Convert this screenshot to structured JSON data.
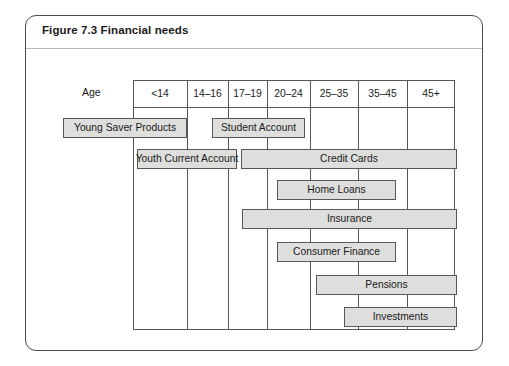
{
  "figure": {
    "title": "Figure 7.3 Financial needs",
    "axis_label": "Age"
  },
  "chart_data": {
    "type": "bar",
    "title": "Figure 7.3 Financial needs",
    "xlabel": "Age",
    "ylabel": "",
    "orientation": "horizontal",
    "grid": true,
    "legend": "none",
    "categories": [
      "<14",
      "14–16",
      "17–19",
      "20–24",
      "25–35",
      "35–45",
      "45+"
    ],
    "axis_ticks_px": [
      133,
      187,
      228,
      267,
      310,
      358,
      407,
      455
    ],
    "bars": [
      {
        "label": "Young Saver Products",
        "row": 0,
        "start_age": "pre-<14",
        "end_age": "14–16",
        "x_start_px": 63,
        "x_end_px": 187,
        "y_px": 118,
        "extends_left_of_grid": true
      },
      {
        "label": "Student Account",
        "row": 0,
        "start_age": "17–19",
        "end_age": "20–24",
        "x_start_px": 212,
        "x_end_px": 305,
        "y_px": 118,
        "extends_left_of_grid": false
      },
      {
        "label": "Youth Current Account",
        "row": 1,
        "start_age": "pre-<14",
        "end_age": "17–19",
        "x_start_px": 137,
        "x_end_px": 237,
        "y_px": 149,
        "extends_left_of_grid": true
      },
      {
        "label": "Credit Cards",
        "row": 1,
        "start_age": "20–24",
        "end_age": "45+",
        "x_start_px": 241,
        "x_end_px": 457,
        "y_px": 149,
        "extends_left_of_grid": false
      },
      {
        "label": "Home Loans",
        "row": 2,
        "start_age": "20–24",
        "end_age": "35–45",
        "x_start_px": 277,
        "x_end_px": 396,
        "y_px": 180,
        "extends_left_of_grid": false
      },
      {
        "label": "Insurance",
        "row": 3,
        "start_age": "20–24",
        "end_age": "45+",
        "x_start_px": 242,
        "x_end_px": 457,
        "y_px": 209,
        "extends_left_of_grid": false
      },
      {
        "label": "Consumer Finance",
        "row": 4,
        "start_age": "20–24",
        "end_age": "35–45",
        "x_start_px": 277,
        "x_end_px": 396,
        "y_px": 242,
        "extends_left_of_grid": false
      },
      {
        "label": "Pensions",
        "row": 5,
        "start_age": "25–35",
        "end_age": "45+",
        "x_start_px": 316,
        "x_end_px": 457,
        "y_px": 275,
        "extends_left_of_grid": false
      },
      {
        "label": "Investments",
        "row": 6,
        "start_age": "35–45",
        "end_age": "45+",
        "x_start_px": 344,
        "x_end_px": 457,
        "y_px": 307,
        "extends_left_of_grid": false
      }
    ]
  },
  "colors": {
    "panel_border": "#4c4c4c",
    "grid_line": "#55565a",
    "bar_fill": "#dededd",
    "bar_border": "#575757",
    "text": "#1a1a1a",
    "rule": "#b9b9b9",
    "background": "#ffffff"
  }
}
